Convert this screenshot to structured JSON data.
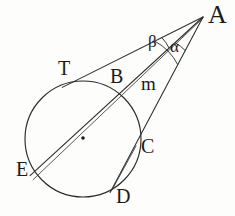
{
  "figure": {
    "kind": "geometry-diagram",
    "width": 235,
    "height": 216,
    "background_color": "#fdfdfb",
    "stroke_color": "#2b2b2b",
    "label_color": "#1b1b1b"
  },
  "labels": {
    "A": "A",
    "T": "T",
    "B": "B",
    "C": "C",
    "D": "D",
    "E": "E",
    "m": "m",
    "alpha": "α",
    "beta": "β"
  },
  "geometry": {
    "circle": {
      "cx": 83,
      "cy": 139,
      "r": 58
    },
    "center_dot": {
      "cx": 83,
      "cy": 138,
      "r": 1.8
    },
    "external_point_A": {
      "x": 203,
      "y": 17
    },
    "tangent_point_T": {
      "x": 73,
      "y": 82
    },
    "secant1_near_B": {
      "x": 122,
      "y": 93
    },
    "secant1_far_E": {
      "x": 33,
      "y": 173
    },
    "secant2_near_C": {
      "x": 137,
      "y": 149
    },
    "secant2_far_D": {
      "x": 112,
      "y": 189
    },
    "angle_arc_beta": {
      "radius": 46,
      "from_line": "tangent-AT",
      "to_line": "secant-AE"
    },
    "angle_arc_alpha": {
      "radius": 38,
      "from_line": "secant-AE",
      "to_line": "secant-AD"
    }
  },
  "elements": {
    "tangent_line": "A-T",
    "secant_line_1": "A-B-E",
    "secant_line_2": "A-C-D",
    "segment_m": "A-B"
  }
}
